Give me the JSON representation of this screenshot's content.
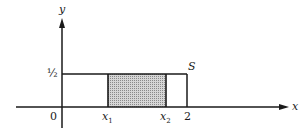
{
  "diagram": {
    "axes": {
      "x_label": "x",
      "y_label": "y",
      "origin_label": "0"
    },
    "y_ticks": [
      {
        "label": "½",
        "value": 0.5
      }
    ],
    "x_ticks": [
      {
        "label": "x",
        "subscript": "1"
      },
      {
        "label": "x",
        "subscript": "2"
      },
      {
        "label": "2",
        "value": 2
      }
    ],
    "region_label": "S",
    "region": {
      "x_from": 0,
      "x_to": 2,
      "y_from": 0,
      "y_to": 0.5
    },
    "shaded_interval": {
      "from": "x1",
      "to": "x2"
    },
    "colors": {
      "line": "#1a1a1a",
      "shade": "#b8b8b8",
      "background": "#ffffff"
    }
  }
}
